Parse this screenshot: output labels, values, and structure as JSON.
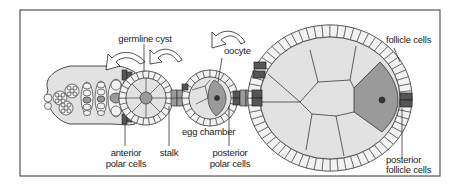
{
  "figure": {
    "type": "schematic diagram",
    "colors": {
      "frame": "#555555",
      "cell_fill": "#e2e2e2",
      "cell_fill_light": "#f2f2f2",
      "oocyte_fill": "#9a9a9a",
      "polar_cell_fill": "#555555",
      "outline": "#222222",
      "arrow_fill": "#ffffff"
    },
    "labels": {
      "germline_cyst": "germline cyst",
      "oocyte": "oocyte",
      "follicle_cells": "follicle cells",
      "egg_chamber": "egg chamber",
      "anterior_polar_cells_line1": "anterior",
      "anterior_polar_cells_line2": "polar cells",
      "stalk": "stalk",
      "posterior_polar_cells_line1": "posterior",
      "posterior_polar_cells_line2": "polar cells",
      "posterior_follicle_cells_line1": "posterior",
      "posterior_follicle_cells_line2": "follicle cells"
    },
    "arrows": [
      {
        "name": "arrow-germarium",
        "direction": "left"
      },
      {
        "name": "arrow-cyst",
        "direction": "left"
      },
      {
        "name": "arrow-egg-chamber",
        "direction": "left"
      }
    ]
  }
}
